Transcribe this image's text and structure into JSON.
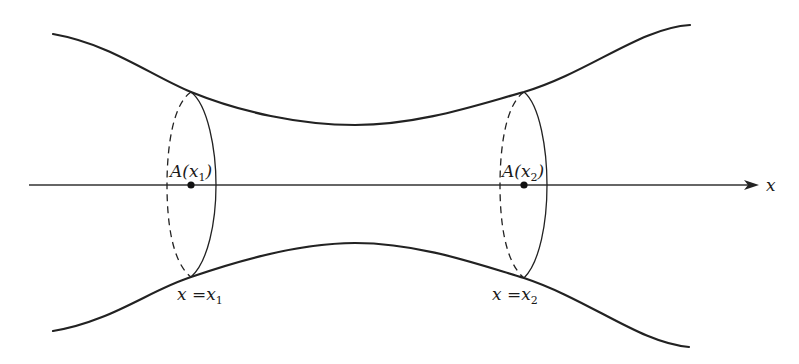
{
  "diagram": {
    "axis": {
      "label": "x"
    },
    "cross_sections": [
      {
        "area_label_main": "A(",
        "area_label_var": "x",
        "area_label_sub": "1",
        "area_label_close": ")",
        "position_label_lhs": "x",
        "position_label_eq": " =",
        "position_label_var": "x",
        "position_label_sub": "1"
      },
      {
        "area_label_main": "A(",
        "area_label_var": "x",
        "area_label_sub": "2",
        "area_label_close": ")",
        "position_label_lhs": "x",
        "position_label_eq": " =",
        "position_label_var": "x",
        "position_label_sub": "2"
      }
    ],
    "colors": {
      "stroke": "#222222",
      "background": "#ffffff"
    }
  }
}
